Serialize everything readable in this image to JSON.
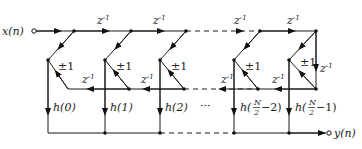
{
  "diagram": {
    "type": "linear-phase FIR filter structure (folded direct form)",
    "input_label": "x(n)",
    "output_label": "y(n)",
    "delay_label": "z",
    "delay_exponent": "-1",
    "sign_label": "±1",
    "ellipsis": "···",
    "coefficients": [
      {
        "prefix": "h(",
        "value": "0",
        "suffix": ")"
      },
      {
        "prefix": "h(",
        "value": "1",
        "suffix": ")"
      },
      {
        "prefix": "h(",
        "value": "2",
        "suffix": ")"
      },
      {
        "prefix": "h(",
        "frac_num": "N",
        "frac_den": "2",
        "rest": "−2)"
      },
      {
        "prefix": "h(",
        "frac_num": "N",
        "frac_den": "2",
        "rest": "−1)"
      }
    ],
    "colors": {
      "line": "#1a1a1a",
      "background": "#ffffff"
    }
  }
}
